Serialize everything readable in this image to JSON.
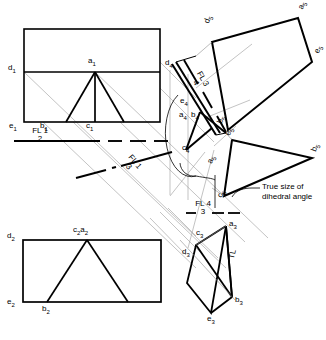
{
  "drawing": {
    "title": "True size of dihedral angle",
    "type": "descriptive-geometry-multiview",
    "colors": {
      "line": "#000000",
      "projector": "#8d8d8d",
      "background": "#ffffff"
    },
    "annotation": {
      "line1": "True size of",
      "line2": "dihedral angle"
    },
    "fold_lines": [
      {
        "name": "fold-line-1-2",
        "numerator": "FL 1",
        "denominator": "2",
        "rotation": 0
      },
      {
        "name": "fold-line-1-3",
        "numerator": "FL 1",
        "denominator": "3",
        "rotation": 52
      },
      {
        "name": "fold-line-3-4",
        "numerator": "FL 3",
        "denominator": "4",
        "rotation": 62
      },
      {
        "name": "fold-line-4-3",
        "numerator": "FL 4",
        "denominator": "3",
        "rotation": 0
      }
    ],
    "views": [
      {
        "name": "view-1-top",
        "points": [
          {
            "label": "a",
            "sub": "1"
          },
          {
            "label": "b",
            "sub": "1"
          },
          {
            "label": "c",
            "sub": "1"
          },
          {
            "label": "d",
            "sub": "1"
          },
          {
            "label": "e",
            "sub": "1"
          }
        ]
      },
      {
        "name": "view-2-front",
        "points": [
          {
            "label": "c",
            "sub": "2"
          },
          {
            "label": "a",
            "sub": "2"
          },
          {
            "label": "d",
            "sub": "2"
          },
          {
            "label": "e",
            "sub": "2"
          },
          {
            "label": "b",
            "sub": "2"
          }
        ]
      },
      {
        "name": "view-3-auxiliary",
        "points": [
          {
            "label": "a",
            "sub": "3"
          },
          {
            "label": "b",
            "sub": "3"
          },
          {
            "label": "c",
            "sub": "3"
          },
          {
            "label": "d",
            "sub": "3"
          },
          {
            "label": "e",
            "sub": "3"
          }
        ],
        "true_length_mark": "TL"
      },
      {
        "name": "view-4-point-view",
        "points": [
          {
            "label": "a",
            "sub": "4"
          },
          {
            "label": "b",
            "sub": "4"
          },
          {
            "label": "c",
            "sub": "4"
          },
          {
            "label": "d",
            "sub": "4"
          },
          {
            "label": "e",
            "sub": "4"
          }
        ]
      },
      {
        "name": "view-5-true-size",
        "points": [
          {
            "label": "a",
            "sub": "5"
          },
          {
            "label": "b",
            "sub": "5"
          },
          {
            "label": "c",
            "sub": "5"
          },
          {
            "label": "d",
            "sub": "5"
          },
          {
            "label": "e",
            "sub": "5"
          }
        ]
      }
    ],
    "labels": {
      "a1": "a",
      "a1s": "1",
      "b1": "b",
      "b1s": "1",
      "c1": "c",
      "c1s": "1",
      "d1": "d",
      "d1s": "1",
      "e1": "e",
      "e1s": "1",
      "d2": "d",
      "d2s": "2",
      "e2": "e",
      "e2s": "2",
      "b2": "b",
      "b2s": "2",
      "c2a2_c": "c",
      "c2a2_cs": "2",
      "c2a2_a": "a",
      "c2a2_as": "2",
      "a3": "a",
      "a3s": "3",
      "b3": "b",
      "b3s": "3",
      "c3": "c",
      "c3s": "3",
      "d3": "d",
      "d3s": "3",
      "e3": "e",
      "e3s": "3",
      "tl": "TL",
      "a4": "a",
      "a4s": "4",
      "b4": "b",
      "b4s": "4",
      "c4": "c",
      "c4s": "4",
      "d4": "d",
      "d4s": "4",
      "e4": "e",
      "e4s": "4",
      "a5": "a",
      "a5s": "5",
      "b5": "b",
      "b5s": "5",
      "c5": "c",
      "c5s": "5",
      "d5": "d",
      "d5s": "5",
      "e5": "e",
      "e5s": "5"
    }
  }
}
